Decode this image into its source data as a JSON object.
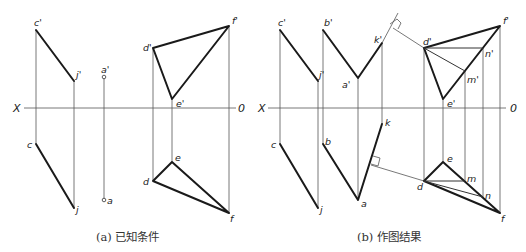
{
  "figures": [
    {
      "id": "a",
      "caption": "(a) 已知条件",
      "axis": {
        "left_label": "X",
        "right_label": "0"
      },
      "labels": {
        "c_prime": "c'",
        "j_prime": "j'",
        "a_prime": "a'",
        "d_prime": "d'",
        "e_prime": "e'",
        "f_prime": "f'",
        "c": "c",
        "j": "j",
        "a": "a",
        "d": "d",
        "e": "e",
        "f": "f"
      }
    },
    {
      "id": "b",
      "caption": "(b) 作图结果",
      "axis": {
        "left_label": "X",
        "right_label": "0"
      },
      "labels": {
        "c_prime": "c'",
        "j_prime": "j'",
        "b_prime": "b'",
        "a_prime": "a'",
        "k_prime": "k'",
        "d_prime": "d'",
        "e_prime": "e'",
        "f_prime": "f'",
        "m_prime": "m'",
        "n_prime": "n'",
        "c": "c",
        "j": "j",
        "b": "b",
        "a": "a",
        "k": "k",
        "d": "d",
        "e": "e",
        "f": "f",
        "m": "m",
        "n": "n"
      }
    }
  ]
}
